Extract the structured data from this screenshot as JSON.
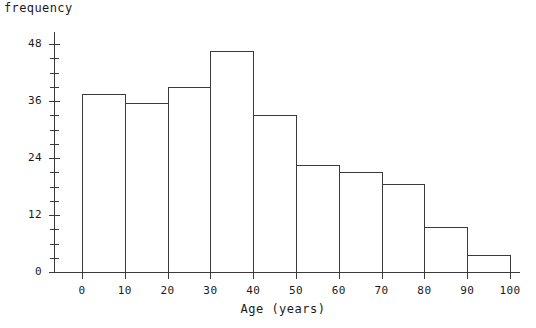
{
  "chart_data": {
    "type": "bar",
    "title": "",
    "subtitle": "",
    "xlabel": "Age (years)",
    "ylabel": "frequency",
    "categories": [
      "0-10",
      "10-20",
      "20-30",
      "30-40",
      "40-50",
      "50-60",
      "60-70",
      "70-80",
      "80-90",
      "90-100"
    ],
    "bin_edges": [
      0,
      10,
      20,
      30,
      40,
      50,
      60,
      70,
      80,
      90,
      100
    ],
    "values": [
      37.5,
      35.5,
      39,
      46.5,
      33,
      22.5,
      21,
      18.5,
      9.5,
      3.5
    ],
    "xlim": [
      0,
      100
    ],
    "ylim": [
      0,
      48
    ],
    "xticks": [
      0,
      10,
      20,
      30,
      40,
      50,
      60,
      70,
      80,
      90,
      100
    ],
    "xtick_labels": [
      "0",
      "10",
      "20",
      "30",
      "40",
      "50",
      "60",
      "70",
      "80",
      "90",
      "100"
    ],
    "yticks": [
      0,
      12,
      24,
      36,
      48
    ],
    "ytick_labels": [
      "0",
      "12",
      "24",
      "36",
      "48"
    ],
    "y_minor_tick_step": 3,
    "grid": false,
    "legend": null,
    "bar_fill": "none",
    "bar_edge_color": "#3a3a3a",
    "axis_color": "#3a3a3a",
    "background": "#ffffff"
  },
  "axes": {
    "y_title": "frequency",
    "x_title": "Age  (years)"
  }
}
